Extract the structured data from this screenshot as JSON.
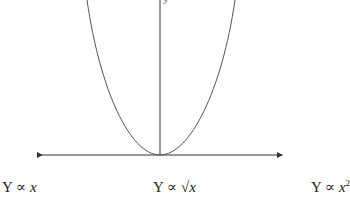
{
  "diagram": {
    "axis_label_y": "y",
    "curve": "parabola",
    "labels": [
      {
        "prefix": "Y ∝ ",
        "var": "x",
        "suffix": ""
      },
      {
        "prefix": "Y ∝ ",
        "var": "√x",
        "suffix": ""
      },
      {
        "prefix": "Y ∝ ",
        "var": "x",
        "suffix": "2"
      }
    ],
    "colors": {
      "line": "#333333",
      "curve": "#555555"
    }
  }
}
